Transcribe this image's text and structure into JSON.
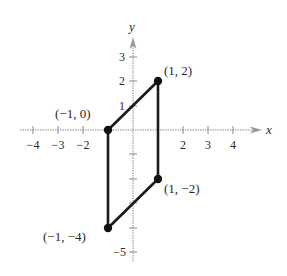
{
  "diagram": {
    "type": "coordinate-plane-polygon",
    "shape": "parallelogram",
    "axes": {
      "x_label": "x",
      "y_label": "y",
      "x_ticks": [
        {
          "value": -4,
          "label": "−4"
        },
        {
          "value": -3,
          "label": "−3"
        },
        {
          "value": -2,
          "label": "−2"
        },
        {
          "value": -1,
          "label": ""
        },
        {
          "value": 1,
          "label": ""
        },
        {
          "value": 2,
          "label": "2"
        },
        {
          "value": 3,
          "label": "3"
        },
        {
          "value": 4,
          "label": "4"
        }
      ],
      "y_ticks": [
        {
          "value": 3,
          "label": "3"
        },
        {
          "value": 2,
          "label": "2"
        },
        {
          "value": 1,
          "label": "1"
        },
        {
          "value": -1,
          "label": ""
        },
        {
          "value": -2,
          "label": ""
        },
        {
          "value": -3,
          "label": ""
        },
        {
          "value": -4,
          "label": ""
        },
        {
          "value": -5,
          "label": "−5"
        }
      ]
    },
    "vertices": [
      {
        "x": -1,
        "y": 0,
        "label": "(−1, 0)"
      },
      {
        "x": 1,
        "y": 2,
        "label": "(1, 2)"
      },
      {
        "x": 1,
        "y": -2,
        "label": "(1, −2)"
      },
      {
        "x": -1,
        "y": -4,
        "label": "(−1, −4)"
      }
    ],
    "colors": {
      "axis": "#8a8a8a",
      "shape": "#1a1a1a",
      "point": "#111111",
      "text": "#2a2a2a"
    }
  }
}
